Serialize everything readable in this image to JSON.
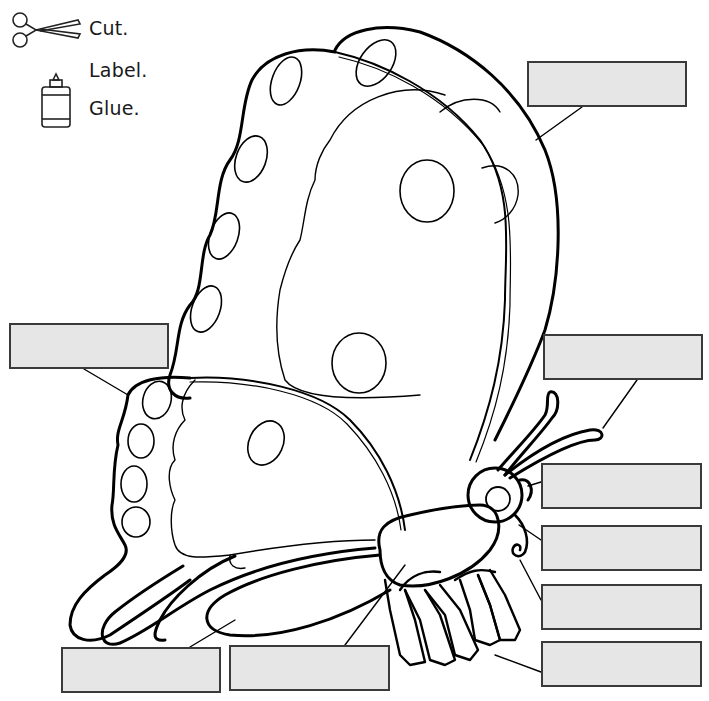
{
  "instructions": {
    "steps": [
      {
        "label": "Cut.",
        "icon": "scissors-icon"
      },
      {
        "label": "Label.",
        "icon": null
      },
      {
        "label": "Glue.",
        "icon": "glue-bottle-icon"
      }
    ]
  },
  "diagram": {
    "colors": {
      "box_fill": "#e6e6e6",
      "box_border": "#3a3a3a",
      "line": "#000000"
    },
    "label_boxes": [
      {
        "id": "box-forewing",
        "text": "",
        "x": 527,
        "y": 61,
        "w": 160,
        "h": 46
      },
      {
        "id": "box-hindwing",
        "text": "",
        "x": 9,
        "y": 323,
        "w": 160,
        "h": 46
      },
      {
        "id": "box-antenna",
        "text": "",
        "x": 543,
        "y": 334,
        "w": 160,
        "h": 46
      },
      {
        "id": "box-eye",
        "text": "",
        "x": 541,
        "y": 463,
        "w": 161,
        "h": 46
      },
      {
        "id": "box-head",
        "text": "",
        "x": 541,
        "y": 525,
        "w": 161,
        "h": 46
      },
      {
        "id": "box-proboscis",
        "text": "",
        "x": 541,
        "y": 584,
        "w": 161,
        "h": 46
      },
      {
        "id": "box-leg",
        "text": "",
        "x": 541,
        "y": 641,
        "w": 161,
        "h": 46
      },
      {
        "id": "box-abdomen",
        "text": "",
        "x": 61,
        "y": 647,
        "w": 160,
        "h": 46
      },
      {
        "id": "box-thorax",
        "text": "",
        "x": 229,
        "y": 645,
        "w": 161,
        "h": 46
      }
    ]
  }
}
